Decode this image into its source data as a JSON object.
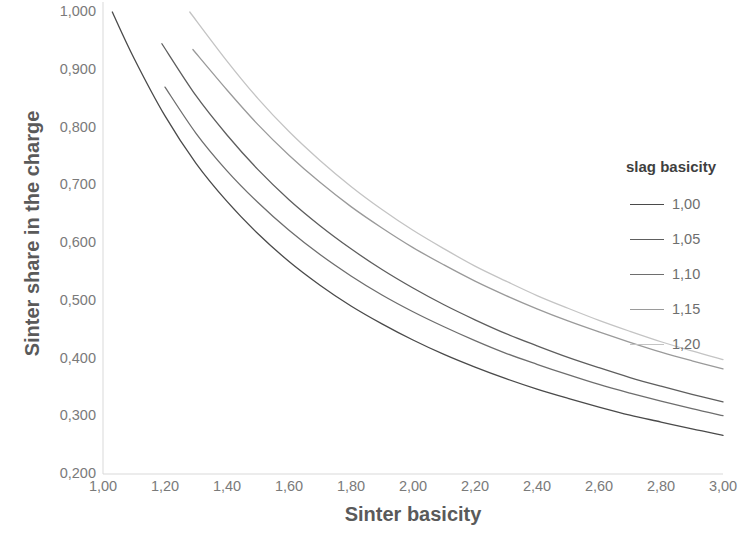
{
  "chart_data": {
    "type": "line",
    "title": "",
    "xlabel": "Sinter basicity",
    "ylabel": "Sinter share in the charge",
    "xlim": [
      1.0,
      3.0
    ],
    "ylim": [
      0.2,
      1.0
    ],
    "grid": false,
    "legend_position": "right",
    "legend_title": "slag basicity",
    "decimal_separator": ",",
    "x_tick_labels": [
      "1,00",
      "1,20",
      "1,40",
      "1,60",
      "1,80",
      "2,00",
      "2,20",
      "2,40",
      "2,60",
      "2,80",
      "3,00"
    ],
    "x_tick_values": [
      1.0,
      1.2,
      1.4,
      1.6,
      1.8,
      2.0,
      2.2,
      2.4,
      2.6,
      2.8,
      3.0
    ],
    "y_tick_labels": [
      "0,200",
      "0,300",
      "0,400",
      "0,500",
      "0,600",
      "0,700",
      "0,800",
      "0,900",
      "1,000"
    ],
    "y_tick_values": [
      0.2,
      0.3,
      0.4,
      0.5,
      0.6,
      0.7,
      0.8,
      0.9,
      1.0
    ],
    "series": [
      {
        "name": "1,00",
        "color": "#4a4a4a",
        "x": [
          1.03,
          1.1,
          1.2,
          1.3,
          1.4,
          1.5,
          1.6,
          1.7,
          1.8,
          1.9,
          2.0,
          2.1,
          2.2,
          2.3,
          2.4,
          2.5,
          2.6,
          2.7,
          2.8,
          2.9,
          3.0
        ],
        "values": [
          1.0,
          0.92,
          0.82,
          0.738,
          0.672,
          0.616,
          0.568,
          0.527,
          0.491,
          0.46,
          0.432,
          0.407,
          0.385,
          0.365,
          0.347,
          0.331,
          0.316,
          0.302,
          0.29,
          0.278,
          0.267
        ]
      },
      {
        "name": "1,05",
        "color": "#5e5e5e",
        "x": [
          1.19,
          1.3,
          1.4,
          1.5,
          1.6,
          1.7,
          1.8,
          1.9,
          2.0,
          2.1,
          2.2,
          2.3,
          2.4,
          2.5,
          2.6,
          2.7,
          2.8,
          2.9,
          3.0
        ],
        "values": [
          0.945,
          0.855,
          0.787,
          0.727,
          0.675,
          0.63,
          0.59,
          0.554,
          0.522,
          0.493,
          0.467,
          0.443,
          0.422,
          0.402,
          0.384,
          0.367,
          0.352,
          0.338,
          0.325
        ]
      },
      {
        "name": "1,10",
        "color": "#6e6e6e",
        "x": [
          1.2,
          1.3,
          1.4,
          1.5,
          1.6,
          1.7,
          1.8,
          1.9,
          2.0,
          2.1,
          2.2,
          2.3,
          2.4,
          2.5,
          2.6,
          2.7,
          2.8,
          2.9,
          3.0
        ],
        "values": [
          0.87,
          0.79,
          0.725,
          0.67,
          0.622,
          0.58,
          0.543,
          0.51,
          0.481,
          0.455,
          0.431,
          0.409,
          0.39,
          0.372,
          0.355,
          0.34,
          0.326,
          0.313,
          0.301
        ]
      },
      {
        "name": "1,15",
        "color": "#9a9a9a",
        "x": [
          1.29,
          1.4,
          1.5,
          1.6,
          1.7,
          1.8,
          1.9,
          2.0,
          2.1,
          2.2,
          2.3,
          2.4,
          2.5,
          2.6,
          2.7,
          2.8,
          2.9,
          3.0
        ],
        "values": [
          0.935,
          0.865,
          0.805,
          0.752,
          0.705,
          0.663,
          0.626,
          0.592,
          0.562,
          0.534,
          0.509,
          0.486,
          0.465,
          0.446,
          0.428,
          0.411,
          0.396,
          0.382
        ]
      },
      {
        "name": "1,20",
        "color": "#c4c4c4",
        "x": [
          1.28,
          1.4,
          1.5,
          1.6,
          1.7,
          1.8,
          1.9,
          2.0,
          2.1,
          2.2,
          2.3,
          2.4,
          2.5,
          2.6,
          2.7,
          2.8,
          2.9,
          3.0
        ],
        "values": [
          1.0,
          0.915,
          0.85,
          0.793,
          0.743,
          0.698,
          0.658,
          0.622,
          0.59,
          0.56,
          0.534,
          0.509,
          0.487,
          0.466,
          0.447,
          0.429,
          0.413,
          0.398
        ]
      }
    ]
  },
  "axes": {
    "axis_line_color": "#d9d9d9",
    "tick_label_color": "#7a7a7a",
    "title_color": "#5a5a5a"
  },
  "legend": {
    "title": "slag basicity",
    "entries": [
      {
        "label": "1,00",
        "color": "#4a4a4a"
      },
      {
        "label": "1,05",
        "color": "#5e5e5e"
      },
      {
        "label": "1,10",
        "color": "#6e6e6e"
      },
      {
        "label": "1,15",
        "color": "#9a9a9a"
      },
      {
        "label": "1,20",
        "color": "#c4c4c4"
      }
    ]
  }
}
